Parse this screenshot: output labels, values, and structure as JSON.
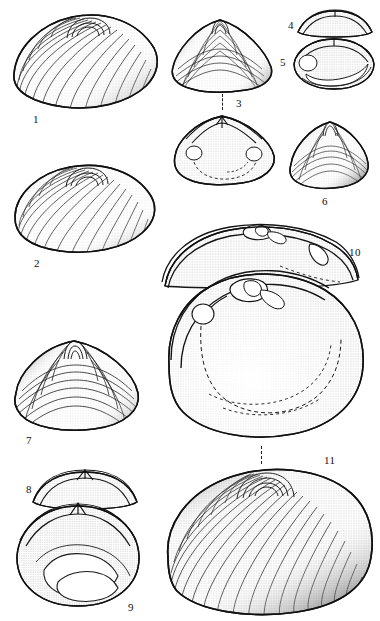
{
  "plate": {
    "title": "Bivalve shell plate",
    "background_color": "#ffffff",
    "ink_color": "#1a1a1a",
    "width": 380,
    "height": 621
  },
  "figures": [
    {
      "number": "1",
      "label_x": 33,
      "label_y": 114,
      "view": "exterior left valve, oblique",
      "box": {
        "x": 10,
        "y": 8,
        "w": 150,
        "h": 104
      },
      "shape": "broad-ovate",
      "shading": "concentric growth lines with stipple on right margin",
      "tick": false
    },
    {
      "number": "2",
      "label_x": 34,
      "label_y": 258,
      "view": "exterior left valve, oblique",
      "box": {
        "x": 12,
        "y": 160,
        "w": 145,
        "h": 98
      },
      "shape": "elongate-ovate",
      "shading": "dense concentric lines, dark left umbo",
      "tick": false
    },
    {
      "number": "3",
      "label_x": 236,
      "label_y": 98,
      "view": "exterior, dorsal-anterior",
      "box": {
        "x": 170,
        "y": 15,
        "w": 105,
        "h": 78
      },
      "shape": "trigonal",
      "shading": "radiating ribs with stippled flanks",
      "tick": true
    },
    {
      "number": "3i",
      "number_hidden": true,
      "label_x": 0,
      "label_y": 0,
      "view": "interior, hinge and muscle scars",
      "box": {
        "x": 172,
        "y": 112,
        "w": 105,
        "h": 75
      },
      "shape": "trigonal",
      "shading": "stippled interior, pallial line dashed",
      "tick": false
    },
    {
      "number": "4",
      "label_x": 288,
      "label_y": 20,
      "view": "dorsal view of hinge",
      "box": {
        "x": 296,
        "y": 8,
        "w": 78,
        "h": 30
      },
      "shape": "narrow-arched",
      "shading": "stippled band",
      "tick": false
    },
    {
      "number": "5",
      "label_x": 280,
      "label_y": 57,
      "view": "interior right valve, hinge detail",
      "box": {
        "x": 292,
        "y": 36,
        "w": 84,
        "h": 56
      },
      "shape": "ovate",
      "shading": "stipple with pallial sinus outline",
      "tick": false
    },
    {
      "number": "6",
      "label_x": 322,
      "label_y": 196,
      "view": "exterior, small valve",
      "box": {
        "x": 288,
        "y": 118,
        "w": 82,
        "h": 72
      },
      "shape": "trigonal-ovate",
      "shading": "concentric lines, dark lower margin",
      "tick": false
    },
    {
      "number": "7",
      "label_x": 26,
      "label_y": 435,
      "view": "exterior left valve",
      "box": {
        "x": 12,
        "y": 337,
        "w": 130,
        "h": 96
      },
      "shape": "rounded-trigonal",
      "shading": "strong concentric ribs, heavy shading at margins",
      "tick": false
    },
    {
      "number": "8",
      "label_x": 26,
      "label_y": 484,
      "view": "dorsal view of hinge",
      "box": {
        "x": 30,
        "y": 468,
        "w": 110,
        "h": 42
      },
      "shape": "arched",
      "shading": "stippled",
      "tick": false
    },
    {
      "number": "9",
      "label_x": 128,
      "label_y": 602,
      "view": "interior valve with pallial sinus",
      "box": {
        "x": 14,
        "y": 500,
        "w": 128,
        "h": 110
      },
      "shape": "ovate",
      "shading": "dense stipple, white pallial sinus",
      "tick": false
    },
    {
      "number": "10",
      "label_x": 349,
      "label_y": 247,
      "view": "hinge area enlarged, two valves",
      "box": {
        "x": 160,
        "y": 222,
        "w": 200,
        "h": 65
      },
      "shape": "arched-hinge",
      "shading": "coarse stipple, dark hinge teeth",
      "tick": false
    },
    {
      "number": "10i",
      "number_hidden": true,
      "label_x": 0,
      "label_y": 0,
      "view": "interior left valve enlarged",
      "box": {
        "x": 165,
        "y": 270,
        "w": 200,
        "h": 175
      },
      "shape": "broad-ovate",
      "shading": "stippled interior, dashed pallial line",
      "tick": true
    },
    {
      "number": "11",
      "label_x": 324,
      "label_y": 455,
      "view": "exterior left valve, large specimen",
      "box": {
        "x": 163,
        "y": 465,
        "w": 212,
        "h": 152
      },
      "shape": "broad-ovate",
      "shading": "dense concentric growth lines with stipple",
      "tick": true
    }
  ],
  "connectors": [
    {
      "name": "fig3-connector",
      "x": 222,
      "y": 94,
      "h": 16
    },
    {
      "name": "fig11-connector",
      "x": 261,
      "y": 446,
      "h": 18
    }
  ]
}
